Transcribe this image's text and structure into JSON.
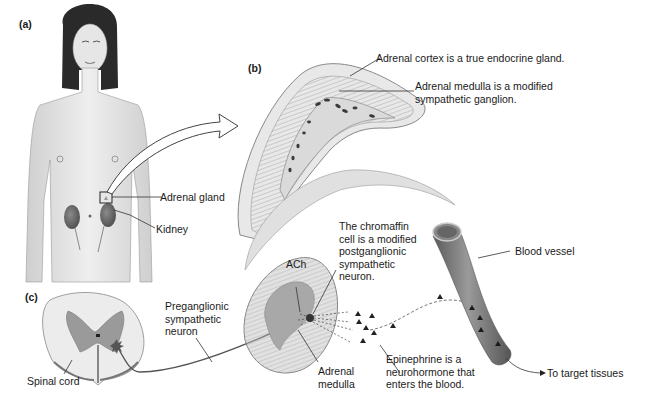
{
  "panels": {
    "a": {
      "label": "(a)",
      "callouts": {
        "adrenal_gland": "Adrenal gland",
        "kidney": "Kidney"
      }
    },
    "b": {
      "label": "(b)",
      "callouts": {
        "cortex": "Adrenal cortex is a true endocrine gland.",
        "medulla_line1": "Adrenal medulla is a modified",
        "medulla_line2": "sympathetic ganglion."
      }
    },
    "c": {
      "label": "(c)",
      "callouts": {
        "spinal_cord": "Spinal cord",
        "preganglionic_line1": "Preganglionic",
        "preganglionic_line2": "sympathetic",
        "preganglionic_line3": "neuron",
        "ach": "ACh",
        "chromaffin_line1": "The chromaffin",
        "chromaffin_line2": "cell is a modified",
        "chromaffin_line3": "postganglionic",
        "chromaffin_line4": "sympathetic",
        "chromaffin_line5": "neuron.",
        "adrenal_medulla_line1": "Adrenal",
        "adrenal_medulla_line2": "medulla",
        "epinephrine_line1": "Epinephrine is a",
        "epinephrine_line2": "neurohormone that",
        "epinephrine_line3": "enters the blood.",
        "blood_vessel": "Blood vessel",
        "target_tissues": "To target tissues"
      }
    }
  },
  "colors": {
    "skin": "#e4e4e4",
    "hair": "#2a2a2a",
    "gland_tissue": "#c9c9c9",
    "medulla_gray": "#a8a8a8",
    "grey_matter": "#9a9a9a",
    "vessel": "#777777",
    "leader_line": "#333333"
  }
}
